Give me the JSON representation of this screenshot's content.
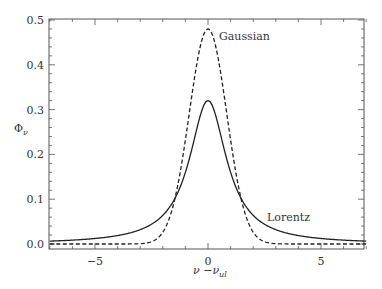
{
  "chart_data": {
    "type": "line",
    "title": "",
    "xlabel": "ν −ν_ul",
    "ylabel": "Φ_ν",
    "xlim": [
      -7,
      7
    ],
    "ylim": [
      0,
      0.5
    ],
    "grid": false,
    "xticks": [
      -5,
      0,
      5
    ],
    "xtick_labels": [
      "−5",
      "0",
      "5"
    ],
    "yticks": [
      0.0,
      0.1,
      0.2,
      0.3,
      0.4,
      0.5
    ],
    "ytick_labels": [
      "0.0",
      "0.1",
      "0.2",
      "0.3",
      "0.4",
      "0.5"
    ],
    "series": [
      {
        "name": "Gaussian",
        "style": "dashed",
        "peak": 0.48,
        "sigma": 0.83,
        "x": [
          -7,
          -5,
          -3,
          -2,
          -1.5,
          -1,
          -0.5,
          0,
          0.5,
          1,
          1.5,
          2,
          3,
          5,
          7
        ],
        "values": [
          0.0,
          0.0,
          0.0007,
          0.0264,
          0.094,
          0.233,
          0.401,
          0.48,
          0.401,
          0.233,
          0.094,
          0.0264,
          0.0007,
          0.0,
          0.0
        ]
      },
      {
        "name": "Lorentz",
        "style": "solid",
        "peak": 0.32,
        "gamma": 1.0,
        "x": [
          -7,
          -5,
          -3,
          -2,
          -1.5,
          -1,
          -0.5,
          0,
          0.5,
          1,
          1.5,
          2,
          3,
          5,
          7
        ],
        "values": [
          0.0064,
          0.0122,
          0.0318,
          0.0637,
          0.098,
          0.159,
          0.255,
          0.318,
          0.255,
          0.159,
          0.098,
          0.0637,
          0.0318,
          0.0122,
          0.0064
        ]
      }
    ],
    "annotations": [
      {
        "text": "Gaussian",
        "near_series": "Gaussian"
      },
      {
        "text": "Lorentz",
        "near_series": "Lorentz"
      }
    ]
  },
  "labels": {
    "gaussian": "Gaussian",
    "lorentz": "Lorentz",
    "ylabel_main": "Φ",
    "ylabel_sub": "ν",
    "xlabel_a": "ν",
    "xlabel_b": " −ν",
    "xlabel_sub": "ul"
  },
  "style": {
    "line_color": "#222222",
    "frame_color": "#555555"
  }
}
